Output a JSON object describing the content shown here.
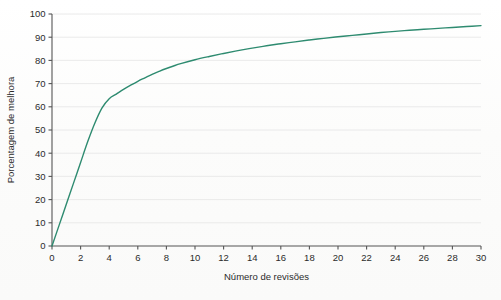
{
  "chart_data": {
    "type": "line",
    "title": "",
    "xlabel": "Número de revisões",
    "ylabel": "Porcentagem de melhora",
    "xlim": [
      0,
      30
    ],
    "ylim": [
      0,
      100
    ],
    "grid": "horizontal",
    "legend": "none",
    "line_color": "#2E8B70",
    "line_width": 1.4,
    "background_color": "#ffffff",
    "grid_color": "#e8e8e8",
    "axis_color": "#555555",
    "text_color": "#2b2b2b",
    "xticks": [
      0,
      2,
      4,
      6,
      8,
      10,
      12,
      14,
      16,
      18,
      20,
      22,
      24,
      26,
      28,
      30
    ],
    "yticks": [
      0,
      10,
      20,
      30,
      40,
      50,
      60,
      70,
      80,
      90,
      100
    ],
    "xtick_labels": [
      "0",
      "2",
      "4",
      "6",
      "8",
      "10",
      "12",
      "14",
      "16",
      "18",
      "20",
      "22",
      "24",
      "26",
      "28",
      "30"
    ],
    "ytick_labels": [
      "0",
      "10",
      "20",
      "30",
      "40",
      "50",
      "60",
      "70",
      "80",
      "90",
      "100"
    ],
    "series": [
      {
        "name": "Porcentagem de melhora acumulada",
        "x": [
          0,
          0.5,
          1,
          1.5,
          2,
          2.5,
          3,
          3.5,
          4,
          4.5,
          5,
          5.5,
          6,
          6.5,
          7,
          7.5,
          8,
          8.5,
          9,
          10,
          11,
          12,
          13,
          14,
          15,
          16,
          17,
          18,
          19,
          20,
          21,
          22,
          23,
          24,
          25,
          26,
          27,
          28,
          29,
          30
        ],
        "y": [
          0,
          9,
          18,
          27,
          36,
          45,
          53,
          59.5,
          63.5,
          65.5,
          67.5,
          69.3,
          71,
          72.5,
          74,
          75.3,
          76.5,
          77.6,
          78.6,
          80.3,
          81.7,
          83.0,
          84.2,
          85.3,
          86.3,
          87.2,
          88.0,
          88.8,
          89.5,
          90.2,
          90.8,
          91.4,
          92.0,
          92.5,
          93.0,
          93.4,
          93.8,
          94.2,
          94.6,
          95.0
        ]
      }
    ]
  },
  "figure": {
    "xlabel": "Número de revisões",
    "ylabel": "Porcentagem de melhora"
  }
}
